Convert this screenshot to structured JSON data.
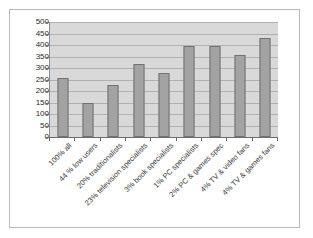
{
  "chart_data": {
    "type": "bar",
    "title": "",
    "xlabel": "",
    "ylabel": "",
    "ylim": [
      0,
      500
    ],
    "ytick_step": 50,
    "grid": true,
    "legend": "none",
    "categories": [
      "100% all",
      "44 % low users",
      "20% traditionalists",
      "23% television specialists",
      "3%  book specialists",
      "1% PC specialists",
      "2% PC & games spec",
      "4% TV & video fans",
      "4% TV & games fans"
    ],
    "values": [
      257,
      149,
      225,
      318,
      277,
      397,
      397,
      357,
      430
    ],
    "ytick_labels": [
      "500",
      "450",
      "400",
      "350",
      "300",
      "250",
      "200",
      "150",
      "100",
      "50",
      "0"
    ],
    "colors": {
      "bar_fill": "#a3a3a3",
      "bar_border": "#737373",
      "plot_background": "#d9d9d9",
      "gridline": "#b0b0b0",
      "axis": "#6b6b6b",
      "frame_border": "#b9b9b9",
      "text": "#2b2b2b"
    }
  }
}
